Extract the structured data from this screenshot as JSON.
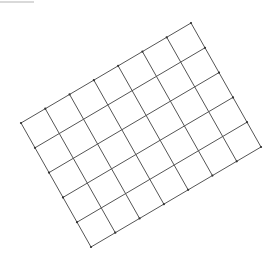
{
  "diagram": {
    "type": "rotated-grid",
    "columns": 7,
    "rows": 5,
    "corners": {
      "top_left": [
        21,
        123
      ],
      "top_right": [
        191,
        23
      ],
      "bottom_right": [
        261,
        147
      ],
      "bottom_left": [
        91,
        247
      ]
    },
    "line_color": "#555555",
    "vertex_color": "#333333",
    "line_width": 1,
    "background": "#ffffff"
  }
}
